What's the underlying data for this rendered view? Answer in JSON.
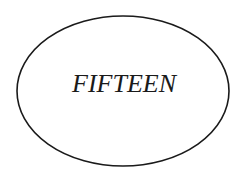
{
  "diagram": {
    "shape": "ellipse",
    "label": "FIFTEEN",
    "stroke_color": "#1a1a1a",
    "fill_color": "#ffffff"
  }
}
